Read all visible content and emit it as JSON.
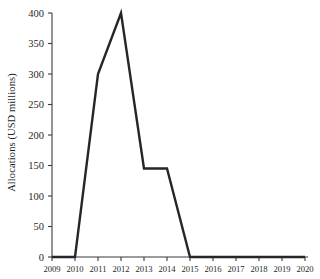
{
  "chart_data": {
    "type": "line",
    "title": "",
    "xlabel": "",
    "ylabel": "Allocations (USD millions)",
    "categories": [
      "2009",
      "2010",
      "2011",
      "2012",
      "2013",
      "2014",
      "2015",
      "2016",
      "2017",
      "2018",
      "2019",
      "2020"
    ],
    "x": [
      2009,
      2010,
      2011,
      2012,
      2013,
      2014,
      2015,
      2016,
      2017,
      2018,
      2019,
      2020
    ],
    "values": [
      0,
      0,
      300,
      400,
      145,
      145,
      0,
      0,
      0,
      0,
      0,
      0
    ],
    "series": [
      {
        "name": "Allocations",
        "values": [
          0,
          0,
          300,
          400,
          145,
          145,
          0,
          0,
          0,
          0,
          0,
          0
        ]
      }
    ],
    "xlim": [
      2009,
      2020
    ],
    "ylim": [
      0,
      400
    ],
    "ytick_labels": [
      "400",
      "350",
      "300",
      "250",
      "200",
      "150",
      "100",
      "50",
      "0"
    ],
    "ytick_values": [
      400,
      350,
      300,
      250,
      200,
      150,
      100,
      50,
      0
    ],
    "xtick_labels": [
      "2009",
      "2010",
      "2011",
      "2012",
      "2013",
      "2014",
      "2015",
      "2016",
      "2017",
      "2018",
      "2019",
      "2020"
    ],
    "grid": false,
    "legend": false,
    "legend_position": "none",
    "line_color": "#262626",
    "background_color": "#ffffff",
    "axis_color": "#3a3a3a"
  },
  "axes": {
    "y_label": "Allocations (USD millions)",
    "y_ticks": [
      "400",
      "350",
      "300",
      "250",
      "200",
      "150",
      "100",
      "50",
      "0"
    ],
    "x_ticks": [
      "2009",
      "2010",
      "2011",
      "2012",
      "2013",
      "2014",
      "2015",
      "2016",
      "2017",
      "2018",
      "2019",
      "2020"
    ]
  }
}
